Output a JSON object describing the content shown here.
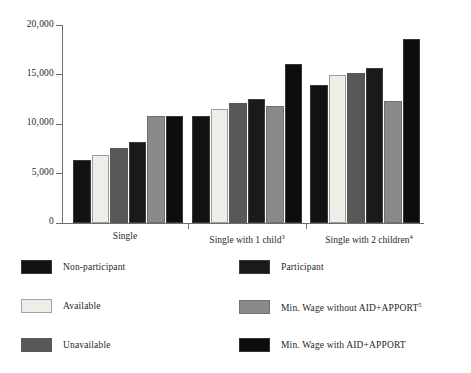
{
  "chart_data": {
    "type": "bar",
    "title": "",
    "xlabel": "",
    "ylabel": "",
    "ylim": [
      0,
      20000
    ],
    "yticks": [
      0,
      5000,
      10000,
      15000,
      20000
    ],
    "ytick_labels": [
      "0",
      "5,000",
      "10,000",
      "15,000",
      "20,000"
    ],
    "grid": false,
    "legend_position": "below-plot-two-columns",
    "categories": [
      "Single",
      "Single with 1 child",
      "Single with 2 children"
    ],
    "category_labels_html": [
      "Single",
      "Single with 1 child³",
      "Single with 2 children⁴"
    ],
    "category_footnotes": [
      "",
      "3",
      "4"
    ],
    "series": [
      {
        "name": "Non-participant",
        "color": "#121212",
        "values": [
          6350,
          10800,
          13950
        ]
      },
      {
        "name": "Available",
        "color": "#eeeee8",
        "values": [
          6900,
          11500,
          14900
        ]
      },
      {
        "name": "Unavailable",
        "color": "#585858",
        "values": [
          7600,
          12100,
          15150
        ]
      },
      {
        "name": "Participant",
        "color": "#1a1a1a",
        "values": [
          8200,
          12550,
          15700
        ]
      },
      {
        "name": "Min. Wage without AID+APPORT",
        "color": "#8a8a8a",
        "values": [
          10800,
          11850,
          12300
        ]
      },
      {
        "name": "Min. Wage with AID+APPORT",
        "color": "#0d0d0d",
        "values": [
          10800,
          16100,
          18600
        ]
      }
    ]
  },
  "axis": {
    "y_tick_labels": [
      "20,000",
      "15,000",
      "10,000",
      "5,000",
      "0"
    ],
    "x_category_1": "Single",
    "x_category_2": "Single with 1 child",
    "x_category_2_sup": "3",
    "x_category_3": "Single with 2 children",
    "x_category_3_sup": "4"
  },
  "legend": {
    "left_column": [
      {
        "label": "Non-participant",
        "sup": "",
        "color": "#121212"
      },
      {
        "label": "Available",
        "sup": "",
        "color": "#eeeee8"
      },
      {
        "label": "Unavailable",
        "sup": "",
        "color": "#585858"
      }
    ],
    "right_column": [
      {
        "label": "Participant",
        "sup": "",
        "color": "#1a1a1a"
      },
      {
        "label": "Min. Wage without AID+APPORT",
        "sup": "5",
        "color": "#8a8a8a"
      },
      {
        "label": "Min. Wage with AID+APPORT",
        "sup": "",
        "color": "#0d0d0d"
      }
    ]
  },
  "colors": {
    "axis": "#6e6e6e",
    "text": "#1f1f1f",
    "background": "#ffffff"
  }
}
